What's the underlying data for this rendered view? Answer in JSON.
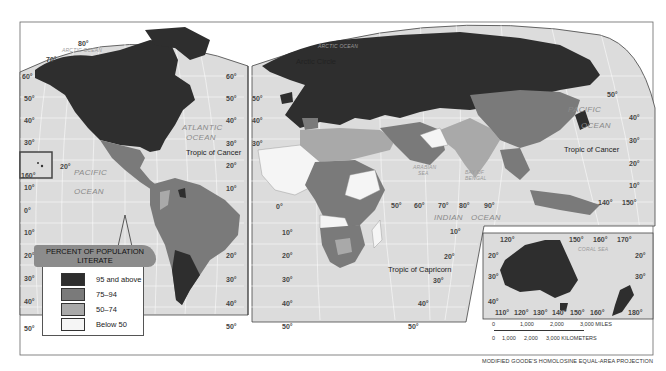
{
  "map": {
    "title": "Percent of Population Literate",
    "projection": "MODIFIED GOODE'S HOMOLOSINE EQUAL-AREA PROJECTION",
    "colors": {
      "background": "#ffffff",
      "ocean": "#dcdcdc",
      "grid": "#ffffff",
      "border": "#555555",
      "class_95_above": "#2e2e2e",
      "class_75_94": "#7a7a7a",
      "class_50_74": "#a9a9a9",
      "class_below_50": "#f5f5f5"
    }
  },
  "legend": {
    "title_line1": "PERCENT OF POPULATION",
    "title_line2": "LITERATE",
    "items": [
      {
        "label": "95 and above",
        "color": "#2e2e2e"
      },
      {
        "label": "75–94",
        "color": "#7a7a7a"
      },
      {
        "label": "50–74",
        "color": "#a9a9a9"
      },
      {
        "label": "Below 50",
        "color": "#f5f5f5"
      }
    ]
  },
  "oceans": {
    "arctic_west": "ARCTIC OCEAN",
    "arctic_east": "ARCTIC OCEAN",
    "atlantic_1": "ATLANTIC",
    "atlantic_2": "OCEAN",
    "pacific_west_1": "PACIFIC",
    "pacific_west_2": "OCEAN",
    "pacific_east_1": "PACIFIC",
    "pacific_east_2": "OCEAN",
    "indian_1": "INDIAN",
    "indian_2": "OCEAN",
    "arabian_1": "ARABIAN",
    "arabian_2": "SEA",
    "bengal_1": "BAY OF",
    "bengal_2": "BENGAL",
    "coral": "CORAL SEA"
  },
  "lines": {
    "arctic_circle": "Arctic Circle",
    "tropic_cancer_west": "Tropic of Cancer",
    "tropic_cancer_east": "Tropic of Cancer",
    "tropic_capricorn": "Tropic of Capricorn"
  },
  "graticule": {
    "americas_left_lat": [
      "60°",
      "50°",
      "40°",
      "30°",
      "20°",
      "10°",
      "0°",
      "10°",
      "20°",
      "30°",
      "40°",
      "50°"
    ],
    "americas_right_lat": [
      "60°",
      "50°",
      "40°",
      "30°",
      "20°",
      "10°",
      "20°",
      "30°",
      "40°",
      "50°"
    ],
    "americas_top_lon": [
      "80°",
      "70°"
    ],
    "hawaii_lon": "160°",
    "hawaii_lat": "20°",
    "eurafrica_left_lat": [
      "50°",
      "40°",
      "30°",
      "0°",
      "10°",
      "20°",
      "30°",
      "40°",
      "50°"
    ],
    "indian_lon": [
      "50°",
      "60°",
      "70°",
      "80°",
      "90°"
    ],
    "indian_lat": [
      "10°",
      "20°",
      "30°",
      "40°",
      "50°"
    ],
    "asia_right_lat": [
      "50°",
      "40°",
      "30°",
      "20°",
      "10°"
    ],
    "asia_lon": [
      "140°",
      "150°"
    ],
    "oceania_top_lon": [
      "120°",
      "150°",
      "160°",
      "170°"
    ],
    "oceania_left_lat": [
      "20°",
      "30°",
      "40°"
    ],
    "oceania_right_lat": [
      "20°",
      "30°"
    ],
    "oceania_bottom_lon": [
      "110°",
      "120°",
      "130°",
      "140°",
      "150°",
      "160°",
      "180°"
    ]
  },
  "scale": {
    "miles": [
      "0",
      "1,000",
      "2,000",
      "3,000 MILES"
    ],
    "kilometers": [
      "0",
      "1,000",
      "2,000",
      "3,000 KILOMETERS"
    ]
  }
}
